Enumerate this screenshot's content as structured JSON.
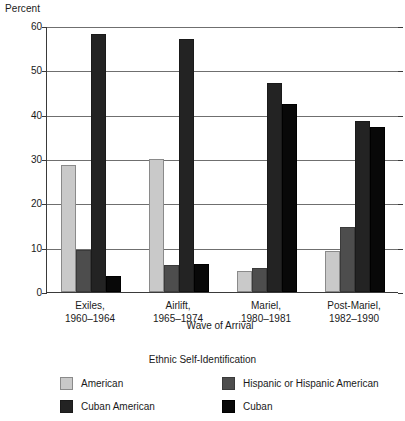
{
  "chart_data": {
    "type": "bar",
    "title": "",
    "ylabel": "Percent",
    "xlabel": "Wave of Arrival",
    "legend_title": "Ethnic Self-Identification",
    "legend_position": "bottom",
    "grid": true,
    "ylim": [
      0,
      60
    ],
    "yticks": [
      0,
      10,
      20,
      30,
      40,
      50,
      60
    ],
    "ytick_labels": [
      "0",
      "10",
      "20",
      "30",
      "40",
      "50",
      "60"
    ],
    "categories": [
      "Exiles,\n1960–1964",
      "Airlift,\n1965–1974",
      "Mariel,\n1980–1981",
      "Post-Mariel,\n1982–1990"
    ],
    "category_lines": [
      [
        "Exiles,",
        "1960–1964"
      ],
      [
        "Airlift,",
        "1965–1974"
      ],
      [
        "Mariel,",
        "1980–1981"
      ],
      [
        "Post-Mariel,",
        "1982–1990"
      ]
    ],
    "series": [
      {
        "name": "American",
        "color": "#c9c9c9",
        "values": [
          28.7,
          30.1,
          4.8,
          9.3
        ]
      },
      {
        "name": "Hispanic or Hispanic American",
        "color": "#4d4d4d",
        "values": [
          9.5,
          6.1,
          5.5,
          14.7
        ]
      },
      {
        "name": "Cuban American",
        "color": "#232323",
        "values": [
          58.3,
          57.1,
          47.2,
          38.6
        ]
      },
      {
        "name": "Cuban",
        "color": "#080808",
        "values": [
          3.6,
          6.4,
          42.3,
          37.2
        ]
      }
    ]
  },
  "legend": {
    "title": "Ethnic Self-Identification",
    "entries": [
      {
        "label": "American",
        "swatch": "light-gray-swatch"
      },
      {
        "label": "Hispanic or Hispanic American",
        "swatch": "dark-gray-swatch"
      },
      {
        "label": "Cuban American",
        "swatch": "very-dark-swatch"
      },
      {
        "label": "Cuban",
        "swatch": "black-swatch"
      }
    ]
  },
  "axes": {
    "y_title": "Percent",
    "x_title": "Wave of Arrival"
  }
}
